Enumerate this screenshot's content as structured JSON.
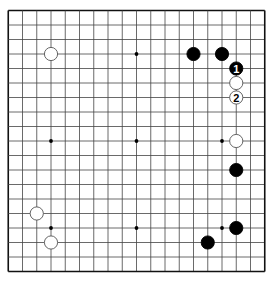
{
  "board": {
    "size": 19,
    "origin_x": 8.25,
    "origin_y": 10.5,
    "spacing_x": 14.25,
    "spacing_y": 14.5,
    "line_color": "#444444",
    "border_color": "#111111",
    "background": "#ffffff",
    "star_points": [
      [
        3,
        9
      ],
      [
        9,
        9
      ],
      [
        15,
        9
      ],
      [
        3,
        15
      ],
      [
        9,
        15
      ],
      [
        15,
        15
      ],
      [
        9,
        3
      ]
    ],
    "stones": [
      {
        "color": "white",
        "col": 3,
        "row": 3,
        "label": ""
      },
      {
        "color": "black",
        "col": 13,
        "row": 3,
        "label": ""
      },
      {
        "color": "black",
        "col": 15,
        "row": 3,
        "label": ""
      },
      {
        "color": "black",
        "col": 16,
        "row": 4,
        "label": "1"
      },
      {
        "color": "white",
        "col": 16,
        "row": 5,
        "label": ""
      },
      {
        "color": "white",
        "col": 16,
        "row": 6,
        "label": "2"
      },
      {
        "color": "white",
        "col": 16,
        "row": 9,
        "label": ""
      },
      {
        "color": "black",
        "col": 16,
        "row": 11,
        "label": ""
      },
      {
        "color": "black",
        "col": 16,
        "row": 15,
        "label": ""
      },
      {
        "color": "black",
        "col": 14,
        "row": 16,
        "label": ""
      },
      {
        "color": "white",
        "col": 2,
        "row": 14,
        "label": ""
      },
      {
        "color": "white",
        "col": 3,
        "row": 16,
        "label": ""
      }
    ]
  }
}
